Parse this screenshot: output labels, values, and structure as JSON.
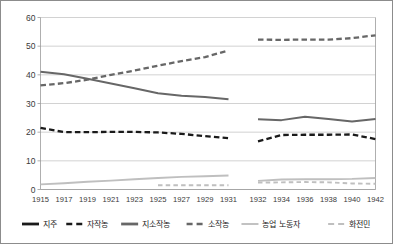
{
  "chart_data": {
    "type": "line",
    "title": "",
    "subtitle": "",
    "xlabel": "",
    "ylabel": "",
    "grid": true,
    "legend_position": "bottom",
    "ylim": [
      0,
      60
    ],
    "yticks": [
      0,
      10,
      20,
      30,
      40,
      50,
      60
    ],
    "ytick_labels": [
      "0",
      "10",
      "20",
      "30",
      "40",
      "50",
      "60"
    ],
    "categories": [
      "1915",
      "1917",
      "1919",
      "1921",
      "1923",
      "1925",
      "1927",
      "1929",
      "1931",
      "1932",
      "1934",
      "1936",
      "1938",
      "1940",
      "1942"
    ],
    "x": [
      1915,
      1917,
      1919,
      1921,
      1923,
      1925,
      1927,
      1929,
      1931,
      1932,
      1934,
      1936,
      1938,
      1940,
      1942
    ],
    "series": [
      {
        "name": "지주",
        "color": "#1a1a1a",
        "style": "solid",
        "width": 2.6,
        "values": [
          null,
          null,
          null,
          null,
          null,
          null,
          null,
          null,
          null,
          null,
          null,
          null,
          null,
          null,
          null
        ]
      },
      {
        "name": "자작농",
        "color": "#1a1a1a",
        "style": "dashed",
        "width": 2.3,
        "values": [
          21.5,
          20.0,
          20.0,
          20.1,
          20.1,
          19.9,
          19.4,
          18.6,
          17.9,
          16.8,
          19.0,
          19.1,
          19.1,
          19.2,
          17.6
        ]
      },
      {
        "name": "지소작농",
        "color": "#676767",
        "style": "solid",
        "width": 2.0,
        "values": [
          41.1,
          40.2,
          38.6,
          37.0,
          35.3,
          33.6,
          32.7,
          32.3,
          31.5,
          24.5,
          24.2,
          25.4,
          24.6,
          23.7,
          24.6
        ]
      },
      {
        "name": "소작농",
        "color": "#676767",
        "style": "dashed",
        "width": 2.3,
        "values": [
          36.3,
          37.1,
          38.3,
          40.0,
          41.5,
          43.2,
          44.8,
          46.2,
          48.5,
          52.3,
          52.2,
          52.3,
          52.3,
          52.8,
          53.8
        ]
      },
      {
        "name": "농업 노동자",
        "color": "#bfbfbf",
        "style": "solid",
        "width": 1.9,
        "values": [
          1.8,
          2.2,
          2.7,
          3.1,
          3.6,
          4.0,
          4.4,
          4.6,
          4.9,
          3.0,
          3.5,
          3.6,
          3.6,
          3.7,
          4.0
        ]
      },
      {
        "name": "화전민",
        "color": "#bfbfbf",
        "style": "dashed",
        "width": 1.9,
        "values": [
          null,
          null,
          null,
          null,
          null,
          1.5,
          1.5,
          1.5,
          1.5,
          2.4,
          2.5,
          2.6,
          2.5,
          2.1,
          2.0
        ]
      }
    ],
    "notes": {
      "break_after_category": "1931",
      "description": "농가 계급 구성 비율 추이 (1915-1942)"
    }
  },
  "legend": {
    "items": [
      {
        "label": "지주",
        "color": "#1a1a1a",
        "style": "solid"
      },
      {
        "label": "자작농",
        "color": "#1a1a1a",
        "style": "dashed"
      },
      {
        "label": "지소작농",
        "color": "#676767",
        "style": "solid"
      },
      {
        "label": "소작농",
        "color": "#676767",
        "style": "dashed"
      },
      {
        "label": "농업 노동자",
        "color": "#bfbfbf",
        "style": "solid"
      },
      {
        "label": "화전민",
        "color": "#bfbfbf",
        "style": "dashed"
      }
    ]
  },
  "colors": {
    "background": "#ffffff",
    "gridline": "#bfbfbf",
    "frame": "#9a9a9a",
    "border": "#8c8c8c",
    "tick_text": "#3a3a3a",
    "legend_text": "#1c1c1c"
  }
}
